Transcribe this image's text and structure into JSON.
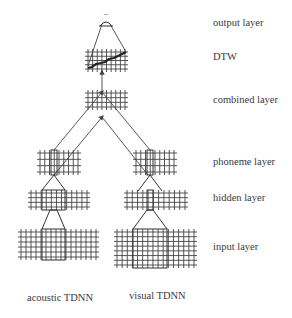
{
  "figure": {
    "layer_labels": {
      "output": "output layer",
      "dtw": "DTW",
      "combined": "combined layer",
      "phoneme": "phoneme layer",
      "hidden": "hidden layer",
      "input": "input layer"
    },
    "network_labels": {
      "acoustic": "acoustic TDNN",
      "visual": "visual TDNN"
    },
    "output_marker": "–"
  }
}
